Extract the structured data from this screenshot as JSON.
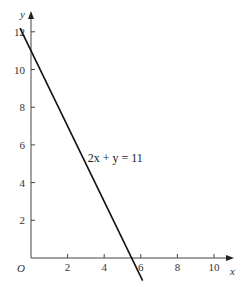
{
  "chart_data": {
    "type": "line",
    "title": "",
    "xlabel": "x",
    "ylabel": "y",
    "origin_label": "O",
    "xlim": [
      0,
      11
    ],
    "ylim": [
      0,
      12.5
    ],
    "grid": false,
    "x_ticks": [
      2,
      4,
      6,
      8,
      10
    ],
    "y_ticks": [
      2,
      4,
      6,
      8,
      10,
      12
    ],
    "x_tick_labels": [
      "2",
      "4",
      "6",
      "8",
      "10"
    ],
    "y_tick_labels": [
      "2",
      "4",
      "6",
      "8",
      "10",
      "12"
    ],
    "series": [
      {
        "name": "2x + y = 11",
        "equation": "y = 11 - 2x",
        "x": [
          -0.6,
          6.1
        ],
        "y": [
          12.2,
          -1.2
        ]
      }
    ],
    "annotations": [
      {
        "text": "2x + y = 11",
        "x": 3.1,
        "y": 5.3
      }
    ],
    "colors": {
      "line": "#111111",
      "axes": "#444444"
    }
  }
}
